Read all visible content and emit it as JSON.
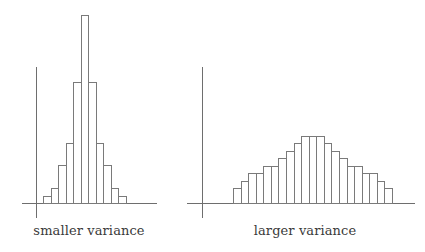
{
  "chart_data": [
    {
      "type": "bar",
      "title": "",
      "caption": "smaller variance",
      "xlabel": "",
      "ylabel": "",
      "grid": false,
      "legend": null,
      "bar_style": "unfilled outline, adjacent bins (histogram)",
      "categories": [
        1,
        2,
        3,
        4,
        5,
        6,
        7,
        8,
        9,
        10,
        11
      ],
      "values": [
        7,
        15,
        38,
        60,
        121,
        188,
        121,
        60,
        38,
        15,
        7
      ],
      "value_units": "relative height (px)",
      "ylim": [
        0,
        200
      ]
    },
    {
      "type": "bar",
      "title": "",
      "caption": "larger variance",
      "xlabel": "",
      "ylabel": "",
      "grid": false,
      "legend": null,
      "bar_style": "unfilled outline, adjacent bins (histogram)",
      "categories": [
        1,
        2,
        3,
        4,
        5,
        6,
        7,
        8,
        9,
        10,
        11,
        12,
        13,
        14,
        15,
        16,
        17,
        18,
        19,
        20,
        21
      ],
      "values": [
        15,
        22,
        30,
        30,
        37,
        37,
        45,
        52,
        60,
        67,
        67,
        67,
        60,
        52,
        45,
        37,
        37,
        30,
        30,
        22,
        15
      ],
      "value_units": "relative height (px)",
      "ylim": [
        0,
        200
      ]
    }
  ],
  "panels": {
    "left": {
      "caption": "smaller variance"
    },
    "right": {
      "caption": "larger variance"
    }
  },
  "colors": {
    "line": "#7a7a7a",
    "axis": "#6e6e6e",
    "text": "#3a3a3a",
    "background": "#ffffff"
  }
}
